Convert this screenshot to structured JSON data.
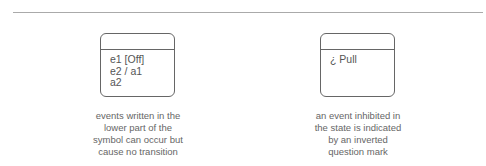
{
  "diagram": {
    "left": {
      "state_body_lines": [
        "e1 [Off]",
        "e2 / a1",
        "a2"
      ],
      "caption_lines": [
        "events written in the",
        "lower part of the",
        "symbol can occur but",
        "cause no transition"
      ]
    },
    "right": {
      "state_body_lines": [
        "¿ Pull"
      ],
      "caption_lines": [
        "an event inhibited in",
        "the state is indicated",
        "by an inverted",
        "question mark"
      ]
    }
  }
}
